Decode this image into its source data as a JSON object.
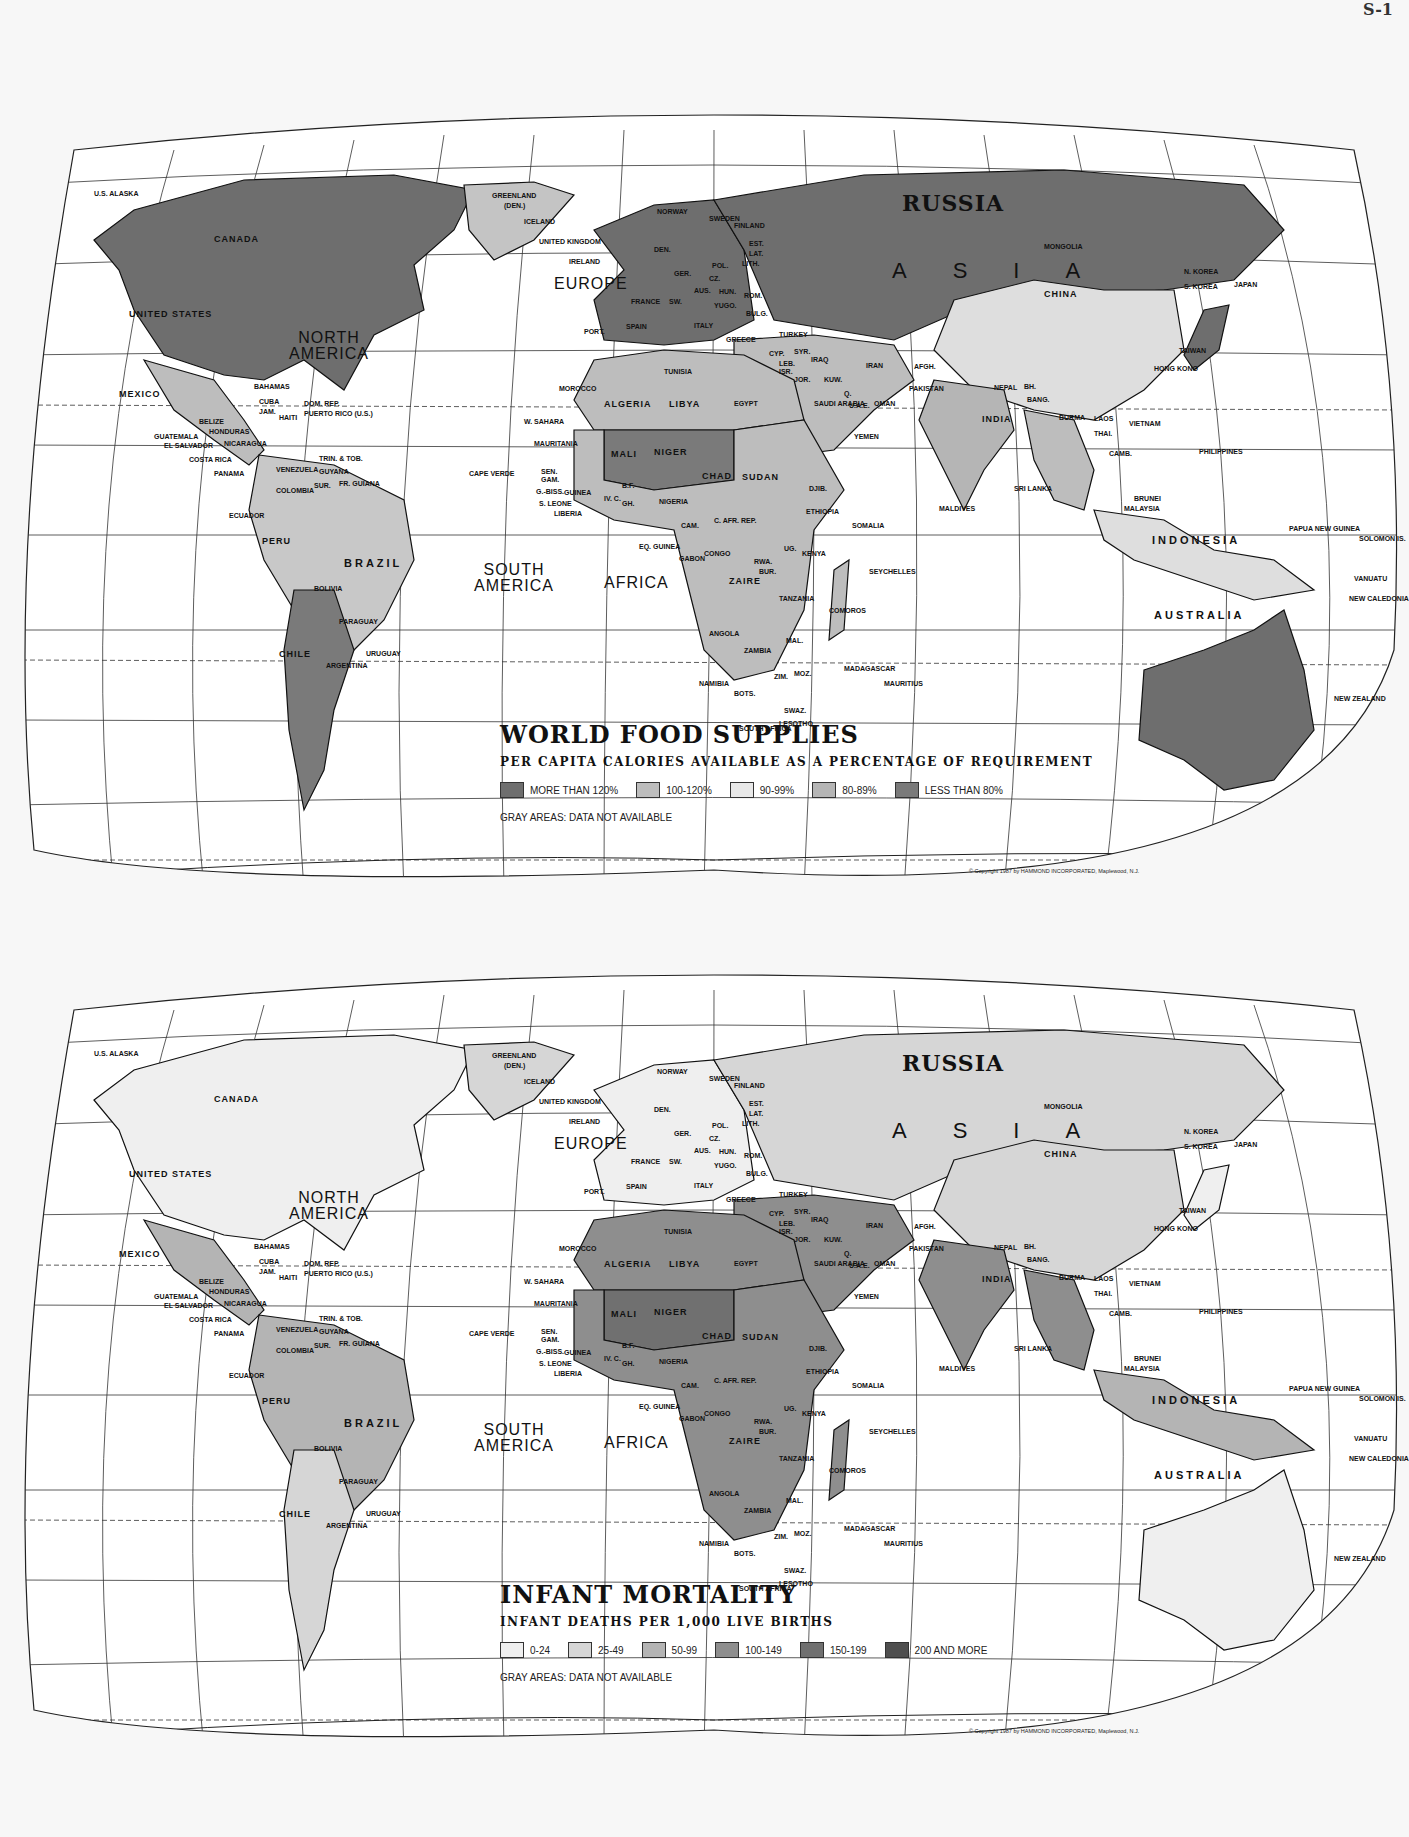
{
  "page": {
    "corner_text": "S-1"
  },
  "maps": [
    {
      "id": "food",
      "title": "WORLD FOOD SUPPLIES",
      "subtitle": "PER CAPITA CALORIES AVAILABLE AS A PERCENTAGE OF REQUIREMENT",
      "legend": [
        {
          "label": "MORE THAN 120%",
          "color": "#6e6e6e"
        },
        {
          "label": "100-120%",
          "color": "#bdbdbd"
        },
        {
          "label": "90-99%",
          "color": "#e8e8e8"
        },
        {
          "label": "80-89%",
          "color": "#b5b5b5"
        },
        {
          "label": "LESS THAN 80%",
          "color": "#7a7a7a"
        }
      ],
      "gray_note": "GRAY AREAS: DATA NOT AVAILABLE",
      "copyright": "© Copyright 1987 by HAMMOND INCORPORATED, Maplewood, N.J.",
      "fills": {
        "north_america": "#6e6e6e",
        "greenland": "#c4c4c4",
        "central_america": "#bdbdbd",
        "south_america": "#c8c8c8",
        "southern_cone": "#7a7a7a",
        "europe": "#6e6e6e",
        "russia": "#6e6e6e",
        "north_africa": "#bdbdbd",
        "sahel": "#7a7a7a",
        "africa": "#bdbdbd",
        "middle_east": "#bdbdbd",
        "china": "#dedede",
        "india": "#b5b5b5",
        "se_asia": "#bdbdbd",
        "japan": "#6e6e6e",
        "indonesia": "#dedede",
        "australia": "#6e6e6e",
        "new_zealand": "#6e6e6e"
      }
    },
    {
      "id": "infant",
      "title": "INFANT MORTALITY",
      "subtitle": "INFANT DEATHS PER 1,000 LIVE BIRTHS",
      "legend": [
        {
          "label": "0-24",
          "color": "#efefef"
        },
        {
          "label": "25-49",
          "color": "#d6d6d6"
        },
        {
          "label": "50-99",
          "color": "#b4b4b4"
        },
        {
          "label": "100-149",
          "color": "#8e8e8e"
        },
        {
          "label": "150-199",
          "color": "#707070"
        },
        {
          "label": "200 AND MORE",
          "color": "#4f4f4f"
        }
      ],
      "gray_note": "GRAY AREAS: DATA NOT AVAILABLE",
      "copyright": "© Copyright 1987 by HAMMOND INCORPORATED, Maplewood, N.J.",
      "fills": {
        "north_america": "#efefef",
        "greenland": "#d6d6d6",
        "central_america": "#b4b4b4",
        "south_america": "#b4b4b4",
        "southern_cone": "#d6d6d6",
        "europe": "#efefef",
        "russia": "#d6d6d6",
        "north_africa": "#8e8e8e",
        "sahel": "#707070",
        "africa": "#8e8e8e",
        "middle_east": "#8e8e8e",
        "china": "#d6d6d6",
        "india": "#8e8e8e",
        "se_asia": "#8e8e8e",
        "japan": "#efefef",
        "indonesia": "#b4b4b4",
        "australia": "#efefef",
        "new_zealand": "#efefef"
      }
    }
  ],
  "labels": {
    "alaska": "U.S. ALASKA",
    "canada": "CANADA",
    "united_states": "UNITED STATES",
    "north_america": "NORTH AMERICA",
    "mexico": "MEXICO",
    "bahamas": "BAHAMAS",
    "cuba": "CUBA",
    "jam": "JAM.",
    "haiti": "HAITI",
    "dom_rep": "DOM. REP.",
    "puerto_rico": "PUERTO RICO (U.S.)",
    "belize": "BELIZE",
    "honduras": "HONDURAS",
    "guatemala": "GUATEMALA",
    "el_salvador": "EL SALVADOR",
    "nicaragua": "NICARAGUA",
    "costa_rica": "COSTA RICA",
    "panama": "PANAMA",
    "trin_tob": "TRIN. & TOB.",
    "venezuela": "VENEZUELA",
    "guyana": "GUYANA",
    "fr_guiana": "FR. GUIANA",
    "sur": "SUR.",
    "colombia": "COLOMBIA",
    "ecuador": "ECUADOR",
    "peru": "PERU",
    "brazil": "BRAZIL",
    "bolivia": "BOLIVIA",
    "paraguay": "PARAGUAY",
    "chile": "CHILE",
    "argentina": "ARGENTINA",
    "uruguay": "URUGUAY",
    "south_america": "SOUTH AMERICA",
    "greenland": "GREENLAND",
    "greenland_sub": "(DEN.)",
    "iceland": "ICELAND",
    "norway": "NORWAY",
    "sweden": "SWEDEN",
    "finland": "FINLAND",
    "uk": "UNITED KINGDOM",
    "ireland": "IRELAND",
    "den": "DEN.",
    "est": "EST.",
    "lat": "LAT.",
    "lith": "LITH.",
    "pol": "POL.",
    "ger": "GER.",
    "cz": "CZ.",
    "aus": "AUS.",
    "hun": "HUN.",
    "rom": "ROM.",
    "bulg": "BULG.",
    "yugo": "YUGO.",
    "europe": "EUROPE",
    "france": "FRANCE",
    "sw": "SW.",
    "spain": "SPAIN",
    "port": "PORT.",
    "italy": "ITALY",
    "greece": "GREECE",
    "turkey": "TURKEY",
    "cyp": "CYP.",
    "syr": "SYR.",
    "leb": "LEB.",
    "isr": "ISR.",
    "jor": "JOR.",
    "iraq": "IRAQ",
    "iran": "IRAN",
    "kuw": "KUW.",
    "q": "Q.",
    "uae": "U.A.E.",
    "saudi": "SAUDI ARABIA",
    "oman": "OMAN",
    "yemen": "YEMEN",
    "afgh": "AFGH.",
    "pakistan": "PAKISTAN",
    "nepal": "NEPAL",
    "bh": "BH.",
    "bang": "BANG.",
    "india": "INDIA",
    "sri_lanka": "SRI LANKA",
    "maldives": "MALDIVES",
    "russia": "RUSSIA",
    "asia": "ASIA",
    "mongolia": "MONGOLIA",
    "china": "CHINA",
    "n_korea": "N. KOREA",
    "s_korea": "S. KOREA",
    "japan": "JAPAN",
    "taiwan": "TAIWAN",
    "hong_kong": "HONG KONG",
    "burma": "BURMA",
    "laos": "LAOS",
    "thai": "THAI.",
    "camb": "CAMB.",
    "vietnam": "VIETNAM",
    "philippines": "PHILIPPINES",
    "brunei": "BRUNEI",
    "malaysia": "MALAYSIA",
    "indonesia": "INDONESIA",
    "papua": "PAPUA NEW GUINEA",
    "solomon": "SOLOMON IS.",
    "vanuatu": "VANUATU",
    "new_caledonia": "NEW CALEDONIA",
    "australia": "AUSTRALIA",
    "new_zealand": "NEW ZEALAND",
    "morocco": "MOROCCO",
    "algeria": "ALGERIA",
    "tunisia": "TUNISIA",
    "libya": "LIBYA",
    "egypt": "EGYPT",
    "w_sahara": "W. SAHARA",
    "mauritania": "MAURITANIA",
    "mali": "MALI",
    "niger": "NIGER",
    "chad": "CHAD",
    "sudan": "SUDAN",
    "cape_verde": "CAPE VERDE",
    "sen": "SEN.",
    "gam": "GAM.",
    "g_biss": "G.-BISS.",
    "guinea": "GUINEA",
    "s_leone": "S. LEONE",
    "liberia": "LIBERIA",
    "iv_c": "IV. C.",
    "gh": "GH.",
    "bf": "B.F.",
    "nigeria": "NIGERIA",
    "djib": "DJIB.",
    "ethiopia": "ETHIOPIA",
    "somalia": "SOMALIA",
    "cam": "CAM.",
    "car": "C. AFR. REP.",
    "eq_guinea": "EQ. GUINEA",
    "gabon": "GABON",
    "congo": "CONGO",
    "ug": "UG.",
    "kenya": "KENYA",
    "rwa": "RWA.",
    "bur": "BUR.",
    "zaire": "ZAIRE",
    "tanzania": "TANZANIA",
    "seychelles": "SEYCHELLES",
    "africa": "AFRICA",
    "angola": "ANGOLA",
    "zambia": "ZAMBIA",
    "mal": "MAL.",
    "comoros": "COMOROS",
    "namibia": "NAMIBIA",
    "zim": "ZIM.",
    "moz": "MOZ.",
    "madagascar": "MADAGASCAR",
    "mauritius": "MAURITIUS",
    "bots": "BOTS.",
    "south_africa": "SOUTH AFRICA",
    "swaz": "SWAZ.",
    "lesotho": "LESOTHO"
  }
}
